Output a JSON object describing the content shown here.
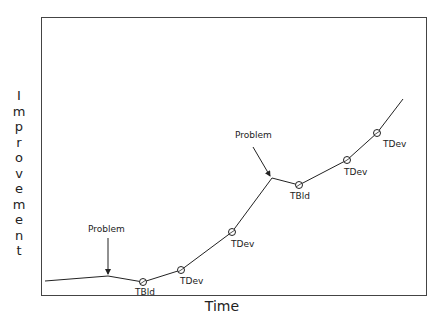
{
  "diagram": {
    "x_axis_label": "Time",
    "y_axis_label": "Improvement",
    "y_axis_letters": [
      "I",
      "m",
      "p",
      "r",
      "o",
      "v",
      "e",
      "m",
      "e",
      "n",
      "t"
    ],
    "line_color": "#222222",
    "path_points": [
      [
        45,
        281
      ],
      [
        108,
        276
      ],
      [
        143,
        282
      ],
      [
        181,
        270
      ],
      [
        232,
        232
      ],
      [
        272,
        178
      ],
      [
        299,
        185
      ],
      [
        347,
        160
      ],
      [
        377,
        133
      ],
      [
        403,
        99
      ]
    ],
    "markers": [
      {
        "label": "TBld",
        "x": 143,
        "y": 282,
        "lx": 135,
        "ly": 295
      },
      {
        "label": "TDev",
        "x": 181,
        "y": 270,
        "lx": 180,
        "ly": 284
      },
      {
        "label": "TDev",
        "x": 232,
        "y": 232,
        "lx": 231,
        "ly": 247
      },
      {
        "label": "TBld",
        "x": 299,
        "y": 185,
        "lx": 290,
        "ly": 199
      },
      {
        "label": "TDev",
        "x": 347,
        "y": 160,
        "lx": 344,
        "ly": 175
      },
      {
        "label": "TDev",
        "x": 377,
        "y": 133,
        "lx": 383,
        "ly": 147
      }
    ],
    "annotations": [
      {
        "label": "Problem",
        "tx": 88,
        "ty": 232,
        "ax1": 108,
        "ay1": 238,
        "ax2": 108,
        "ay2": 274
      },
      {
        "label": "Problem",
        "tx": 235,
        "ty": 138,
        "ax1": 253,
        "ay1": 147,
        "ax2": 270,
        "ay2": 176
      }
    ]
  }
}
